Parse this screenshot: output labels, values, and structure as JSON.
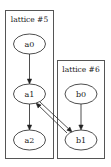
{
  "graph": {
    "clusters": [
      {
        "id": "cluster5",
        "label": "lattice #5",
        "x": 5.5,
        "y": 10.5,
        "w": 48,
        "h": 148,
        "label_x": 29.5,
        "label_y": 22
      },
      {
        "id": "cluster6",
        "label": "lattice #6",
        "x": 57.5,
        "y": 60.5,
        "w": 47,
        "h": 98,
        "label_x": 81,
        "label_y": 72
      }
    ],
    "nodes": [
      {
        "id": "a0",
        "label": "a0",
        "cx": 29.5,
        "cy": 44,
        "rx": 16,
        "ry": 10
      },
      {
        "id": "a1",
        "label": "a1",
        "cx": 29.5,
        "cy": 94,
        "rx": 16,
        "ry": 10
      },
      {
        "id": "a2",
        "label": "a2",
        "cx": 29.5,
        "cy": 140,
        "rx": 16,
        "ry": 10
      },
      {
        "id": "b0",
        "label": "b0",
        "cx": 81,
        "cy": 94,
        "rx": 16,
        "ry": 10
      },
      {
        "id": "b1",
        "label": "b1",
        "cx": 81,
        "cy": 140,
        "rx": 16,
        "ry": 10
      }
    ],
    "edges": [
      {
        "from": "a0",
        "to": "a1",
        "x1": 29.5,
        "y1": 54,
        "x2": 29.5,
        "y2": 84
      },
      {
        "from": "a1",
        "to": "a2",
        "x1": 29.5,
        "y1": 104,
        "x2": 29.5,
        "y2": 130
      },
      {
        "from": "b0",
        "to": "b1",
        "x1": 81,
        "y1": 104,
        "x2": 81,
        "y2": 130
      },
      {
        "from": "a1",
        "to": "b1",
        "x1": 40,
        "y1": 102,
        "x2": 72,
        "y2": 132
      },
      {
        "from": "b1",
        "to": "a1",
        "x1": 67,
        "y1": 133,
        "x2": 36,
        "y2": 103
      }
    ]
  }
}
